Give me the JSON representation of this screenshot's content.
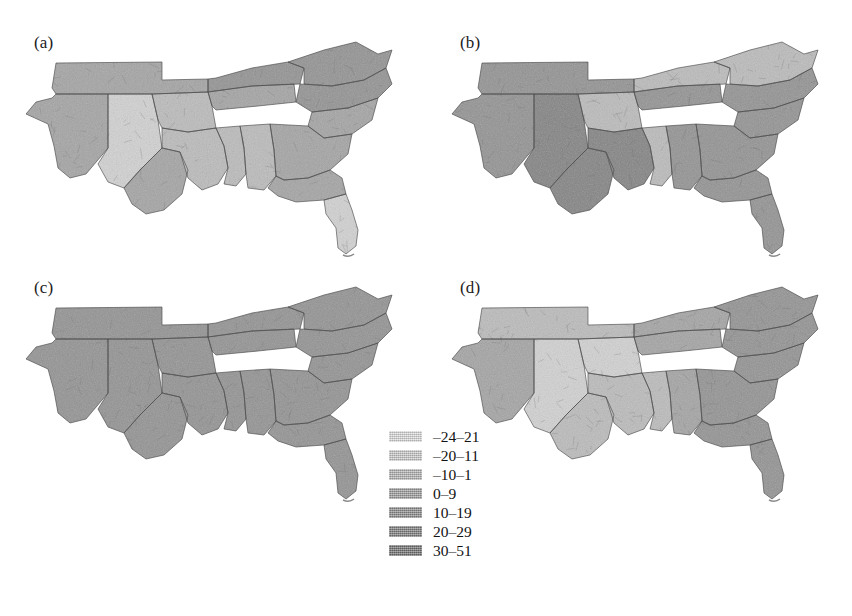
{
  "figure": {
    "type": "choropleth-map-grid",
    "background_color": "#ffffff",
    "rows": 2,
    "columns": 2,
    "region": "Southern United States",
    "geographic_unit": "county"
  },
  "panels": [
    {
      "id": "a",
      "label": "(a)"
    },
    {
      "id": "b",
      "label": "(b)"
    },
    {
      "id": "c",
      "label": "(c)"
    },
    {
      "id": "d",
      "label": "(d)"
    }
  ],
  "legend": {
    "position": "center-bottom",
    "classes": 7,
    "items": [
      {
        "label": "–24–21",
        "color": "#e3e3e3",
        "min": -24,
        "max": -21
      },
      {
        "label": "–20–11",
        "color": "#d2d2d2",
        "min": -20,
        "max": -11
      },
      {
        "label": "–10–1",
        "color": "#bcbcbc",
        "min": -10,
        "max": -1
      },
      {
        "label": "0–9",
        "color": "#a5a5a5",
        "min": 0,
        "max": 9
      },
      {
        "label": "10–19",
        "color": "#949494",
        "min": 10,
        "max": 19
      },
      {
        "label": "20–29",
        "color": "#858585",
        "min": 20,
        "max": 29
      },
      {
        "label": "30–51",
        "color": "#787878",
        "min": 30,
        "max": 51
      }
    ]
  },
  "chart_data": {
    "type": "heatmap",
    "title": "",
    "xlabel": "",
    "ylabel": "",
    "map_projection": "albers",
    "region_extent": "Texas to Virginia including Florida",
    "legend_position": "center-bottom",
    "grid": false,
    "class_breaks": [
      -24,
      -20,
      -10,
      0,
      10,
      20,
      30,
      51
    ],
    "class_labels": [
      "–24–21",
      "–20–11",
      "–10–1",
      "0–9",
      "10–19",
      "20–29",
      "30–51"
    ],
    "class_colors": [
      "#e3e3e3",
      "#d2d2d2",
      "#bcbcbc",
      "#a5a5a5",
      "#949494",
      "#858585",
      "#787878"
    ],
    "panels": [
      {
        "name": "(a)",
        "regions": [
          {
            "area": "west-texas",
            "class_index": 3,
            "value_range": "0–9"
          },
          {
            "area": "central-texas",
            "class_index": 1,
            "value_range": "–20–11"
          },
          {
            "area": "south-texas",
            "class_index": 3,
            "value_range": "0–9"
          },
          {
            "area": "oklahoma",
            "class_index": 3,
            "value_range": "0–9"
          },
          {
            "area": "louisiana",
            "class_index": 2,
            "value_range": "–10–1"
          },
          {
            "area": "arkansas",
            "class_index": 2,
            "value_range": "–10–1"
          },
          {
            "area": "mississippi",
            "class_index": 2,
            "value_range": "–10–1"
          },
          {
            "area": "alabama",
            "class_index": 2,
            "value_range": "–10–1"
          },
          {
            "area": "tennessee",
            "class_index": 3,
            "value_range": "0–9"
          },
          {
            "area": "kentucky",
            "class_index": 4,
            "value_range": "10–19"
          },
          {
            "area": "virginia",
            "class_index": 4,
            "value_range": "10–19"
          },
          {
            "area": "north-carolina",
            "class_index": 4,
            "value_range": "10–19"
          },
          {
            "area": "south-carolina",
            "class_index": 3,
            "value_range": "0–9"
          },
          {
            "area": "georgia",
            "class_index": 3,
            "value_range": "0–9"
          },
          {
            "area": "north-florida",
            "class_index": 3,
            "value_range": "0–9"
          },
          {
            "area": "south-florida",
            "class_index": 1,
            "value_range": "–20–11"
          }
        ]
      },
      {
        "name": "(b)",
        "regions": [
          {
            "area": "west-texas",
            "class_index": 4,
            "value_range": "10–19"
          },
          {
            "area": "central-texas",
            "class_index": 5,
            "value_range": "20–29"
          },
          {
            "area": "south-texas",
            "class_index": 5,
            "value_range": "20–29"
          },
          {
            "area": "oklahoma",
            "class_index": 4,
            "value_range": "10–19"
          },
          {
            "area": "louisiana",
            "class_index": 5,
            "value_range": "20–29"
          },
          {
            "area": "arkansas",
            "class_index": 2,
            "value_range": "–10–1"
          },
          {
            "area": "mississippi",
            "class_index": 2,
            "value_range": "–10–1"
          },
          {
            "area": "alabama",
            "class_index": 4,
            "value_range": "10–19"
          },
          {
            "area": "tennessee",
            "class_index": 4,
            "value_range": "10–19"
          },
          {
            "area": "kentucky",
            "class_index": 2,
            "value_range": "–10–1"
          },
          {
            "area": "virginia",
            "class_index": 2,
            "value_range": "–10–1"
          },
          {
            "area": "north-carolina",
            "class_index": 4,
            "value_range": "10–19"
          },
          {
            "area": "south-carolina",
            "class_index": 4,
            "value_range": "10–19"
          },
          {
            "area": "georgia",
            "class_index": 4,
            "value_range": "10–19"
          },
          {
            "area": "north-florida",
            "class_index": 4,
            "value_range": "10–19"
          },
          {
            "area": "south-florida",
            "class_index": 4,
            "value_range": "10–19"
          }
        ]
      },
      {
        "name": "(c)",
        "regions": [
          {
            "area": "west-texas",
            "class_index": 4,
            "value_range": "10–19"
          },
          {
            "area": "central-texas",
            "class_index": 4,
            "value_range": "10–19"
          },
          {
            "area": "south-texas",
            "class_index": 4,
            "value_range": "10–19"
          },
          {
            "area": "oklahoma",
            "class_index": 4,
            "value_range": "10–19"
          },
          {
            "area": "louisiana",
            "class_index": 4,
            "value_range": "10–19"
          },
          {
            "area": "arkansas",
            "class_index": 4,
            "value_range": "10–19"
          },
          {
            "area": "mississippi",
            "class_index": 4,
            "value_range": "10–19"
          },
          {
            "area": "alabama",
            "class_index": 4,
            "value_range": "10–19"
          },
          {
            "area": "tennessee",
            "class_index": 4,
            "value_range": "10–19"
          },
          {
            "area": "kentucky",
            "class_index": 4,
            "value_range": "10–19"
          },
          {
            "area": "virginia",
            "class_index": 4,
            "value_range": "10–19"
          },
          {
            "area": "north-carolina",
            "class_index": 4,
            "value_range": "10–19"
          },
          {
            "area": "south-carolina",
            "class_index": 4,
            "value_range": "10–19"
          },
          {
            "area": "georgia",
            "class_index": 4,
            "value_range": "10–19"
          },
          {
            "area": "north-florida",
            "class_index": 4,
            "value_range": "10–19"
          },
          {
            "area": "south-florida",
            "class_index": 4,
            "value_range": "10–19"
          }
        ]
      },
      {
        "name": "(d)",
        "regions": [
          {
            "area": "west-texas",
            "class_index": 3,
            "value_range": "0–9"
          },
          {
            "area": "central-texas",
            "class_index": 1,
            "value_range": "–20–11"
          },
          {
            "area": "south-texas",
            "class_index": 2,
            "value_range": "–10–1"
          },
          {
            "area": "oklahoma",
            "class_index": 2,
            "value_range": "–10–1"
          },
          {
            "area": "louisiana",
            "class_index": 2,
            "value_range": "–10–1"
          },
          {
            "area": "arkansas",
            "class_index": 1,
            "value_range": "–20–11"
          },
          {
            "area": "mississippi",
            "class_index": 2,
            "value_range": "–10–1"
          },
          {
            "area": "alabama",
            "class_index": 3,
            "value_range": "0–9"
          },
          {
            "area": "tennessee",
            "class_index": 3,
            "value_range": "0–9"
          },
          {
            "area": "kentucky",
            "class_index": 3,
            "value_range": "0–9"
          },
          {
            "area": "virginia",
            "class_index": 4,
            "value_range": "10–19"
          },
          {
            "area": "north-carolina",
            "class_index": 4,
            "value_range": "10–19"
          },
          {
            "area": "south-carolina",
            "class_index": 4,
            "value_range": "10–19"
          },
          {
            "area": "georgia",
            "class_index": 4,
            "value_range": "10–19"
          },
          {
            "area": "north-florida",
            "class_index": 4,
            "value_range": "10–19"
          },
          {
            "area": "south-florida",
            "class_index": 4,
            "value_range": "10–19"
          }
        ]
      }
    ]
  }
}
